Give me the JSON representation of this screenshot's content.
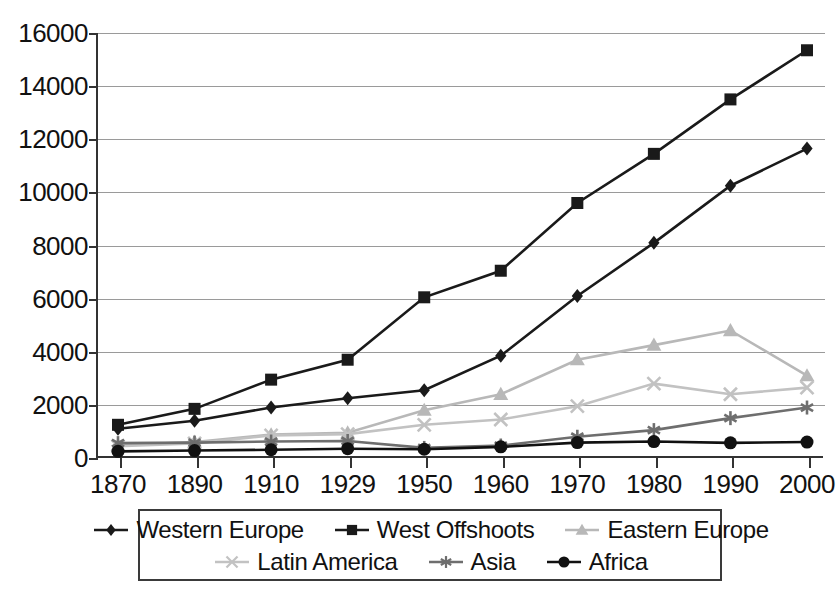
{
  "chart_data": {
    "type": "line",
    "title": "",
    "xlabel": "",
    "ylabel": "",
    "categories": [
      "1870",
      "1890",
      "1910",
      "1929",
      "1950",
      "1960",
      "1970",
      "1980",
      "1990",
      "2000"
    ],
    "ylim": [
      0,
      16000
    ],
    "ytick_labels": [
      "0",
      "2000",
      "4000",
      "6000",
      "8000",
      "10000",
      "12000",
      "14000",
      "16000"
    ],
    "ytick_values": [
      0,
      2000,
      4000,
      6000,
      8000,
      10000,
      12000,
      14000,
      16000
    ],
    "grid": true,
    "legend_position": "bottom",
    "series": [
      {
        "name": "Western Europe",
        "marker": "diamond",
        "color": "#1a1a1a",
        "values": [
          1100,
          1400,
          1900,
          2250,
          2550,
          3850,
          6100,
          8100,
          10250,
          11650
        ]
      },
      {
        "name": "West Offshoots",
        "marker": "square",
        "color": "#1a1a1a",
        "values": [
          1250,
          1850,
          2950,
          3700,
          6050,
          7050,
          9600,
          11450,
          13500,
          15350
        ]
      },
      {
        "name": "Eastern Europe",
        "marker": "triangle",
        "color": "#b8b8b8",
        "values": [
          480,
          600,
          880,
          950,
          1800,
          2400,
          3700,
          4250,
          4800,
          3100
        ]
      },
      {
        "name": "Latin America",
        "marker": "x",
        "color": "#c2c2c2",
        "values": [
          440,
          550,
          850,
          900,
          1250,
          1450,
          1950,
          2800,
          2400,
          2650
        ]
      },
      {
        "name": "Asia",
        "marker": "asterisk",
        "color": "#6e6e6e",
        "values": [
          560,
          580,
          620,
          640,
          380,
          470,
          800,
          1050,
          1500,
          1900
        ]
      },
      {
        "name": "Africa",
        "marker": "circle",
        "color": "#111111",
        "values": [
          250,
          280,
          310,
          350,
          330,
          420,
          580,
          620,
          570,
          600
        ]
      }
    ]
  },
  "legend": {
    "rows": [
      [
        "Western Europe",
        "West Offshoots",
        "Eastern Europe"
      ],
      [
        "Latin America",
        "Asia",
        "Africa"
      ]
    ]
  }
}
